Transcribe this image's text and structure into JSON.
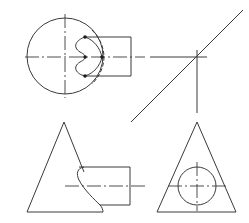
{
  "drawing": {
    "type": "orthographic-projection",
    "description": "Three-view engineering drawing of a cone intersected by a horizontal cylinder, with a 45-degree miter line",
    "views": [
      {
        "name": "top-view",
        "contents": [
          "circle-outline",
          "cylinder-rectangle",
          "intersection-curve",
          "hidden-arc",
          "center-lines",
          "key-points"
        ]
      },
      {
        "name": "front-view",
        "contents": [
          "cone-triangle",
          "cylinder-body",
          "intersection-curve",
          "center-line"
        ]
      },
      {
        "name": "side-view",
        "contents": [
          "cone-triangle",
          "cylinder-circle",
          "center-lines"
        ]
      }
    ],
    "construction": [
      "miter-line-45deg",
      "projection-lines"
    ],
    "key_point_count": 4,
    "colors": {
      "line": "#3a3a3a",
      "point": "#1a1a1a",
      "background": "#ffffff"
    }
  }
}
